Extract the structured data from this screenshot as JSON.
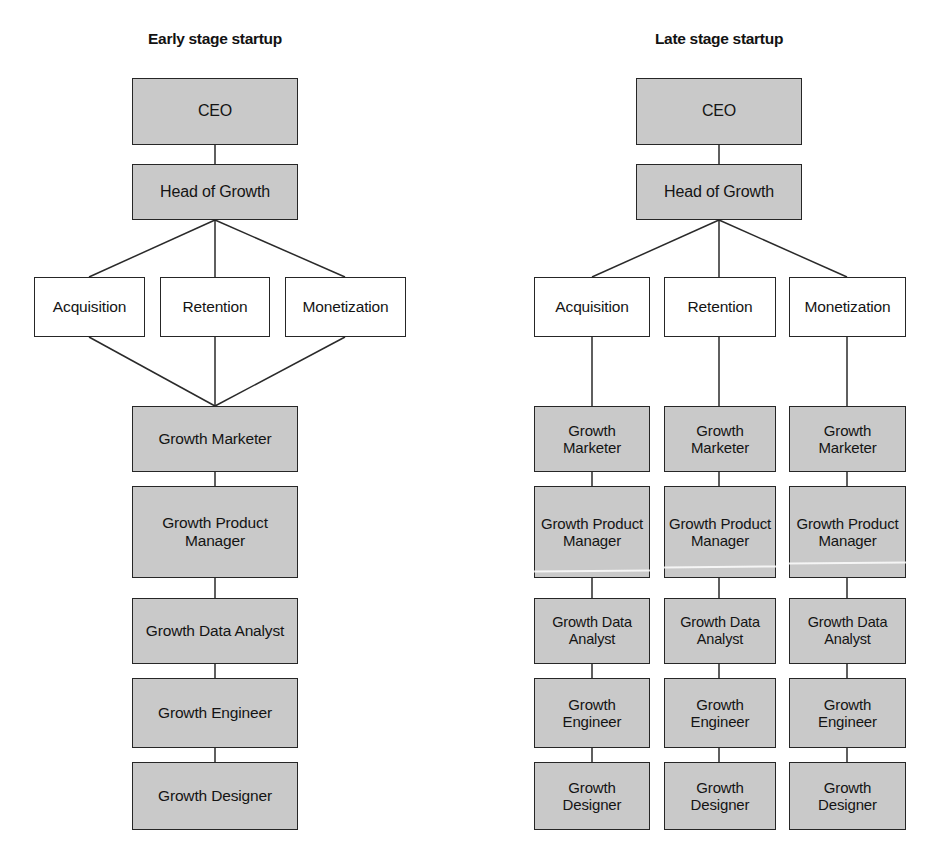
{
  "diagram": {
    "title_left": "Early stage startup",
    "title_right": "Late stage startup",
    "colors": {
      "box_fill_gray": "#c9c9c9",
      "box_fill_white": "#ffffff",
      "border": "#262626",
      "text": "#141414",
      "connector": "#2a2a2a",
      "background": "#ffffff"
    },
    "columns": [
      {
        "id": "early-stage",
        "title": "Early stage startup",
        "structure": "shared-team",
        "leadership": [
          {
            "label": "CEO",
            "style": "gray"
          },
          {
            "label": "Head of Growth",
            "style": "gray"
          }
        ],
        "functions": [
          {
            "label": "Acquisition",
            "style": "white"
          },
          {
            "label": "Retention",
            "style": "white"
          },
          {
            "label": "Monetization",
            "style": "white"
          }
        ],
        "roles": [
          {
            "label": "Growth Marketer",
            "style": "gray"
          },
          {
            "label": "Growth Product Manager",
            "style": "gray"
          },
          {
            "label": "Growth Data Analyst",
            "style": "gray"
          },
          {
            "label": "Growth Engineer",
            "style": "gray"
          },
          {
            "label": "Growth Designer",
            "style": "gray"
          }
        ]
      },
      {
        "id": "late-stage",
        "title": "Late stage startup",
        "structure": "dedicated-teams",
        "leadership": [
          {
            "label": "CEO",
            "style": "gray"
          },
          {
            "label": "Head of Growth",
            "style": "gray"
          }
        ],
        "functions": [
          {
            "label": "Acquisition",
            "style": "white"
          },
          {
            "label": "Retention",
            "style": "white"
          },
          {
            "label": "Monetization",
            "style": "white"
          }
        ],
        "teams": [
          {
            "function": "Acquisition",
            "roles": [
              {
                "label": "Growth Marketer",
                "style": "gray"
              },
              {
                "label": "Growth Product Manager",
                "style": "gray"
              },
              {
                "label": "Growth Data Analyst",
                "style": "gray"
              },
              {
                "label": "Growth Engineer",
                "style": "gray"
              },
              {
                "label": "Growth Designer",
                "style": "gray"
              }
            ]
          },
          {
            "function": "Retention",
            "roles": [
              {
                "label": "Growth Marketer",
                "style": "gray"
              },
              {
                "label": "Growth Product Manager",
                "style": "gray"
              },
              {
                "label": "Growth Data Analyst",
                "style": "gray"
              },
              {
                "label": "Growth Engineer",
                "style": "gray"
              },
              {
                "label": "Growth Designer",
                "style": "gray"
              }
            ]
          },
          {
            "function": "Monetization",
            "roles": [
              {
                "label": "Growth Marketer",
                "style": "gray"
              },
              {
                "label": "Growth Product Manager",
                "style": "gray"
              },
              {
                "label": "Growth Data Analyst",
                "style": "gray"
              },
              {
                "label": "Growth Engineer",
                "style": "gray"
              },
              {
                "label": "Growth Designer",
                "style": "gray"
              }
            ]
          }
        ]
      }
    ]
  }
}
